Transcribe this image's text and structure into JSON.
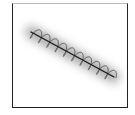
{
  "figure": {
    "colors": {
      "frame": "#222222",
      "axis_line": "#1a1a1a",
      "coil": "#555555",
      "shadow": "#9a9a9a",
      "background": "#ffffff"
    },
    "axis": {
      "x1": 31,
      "y1": 32,
      "x2": 114,
      "y2": 77
    },
    "coil_turns": 10
  }
}
